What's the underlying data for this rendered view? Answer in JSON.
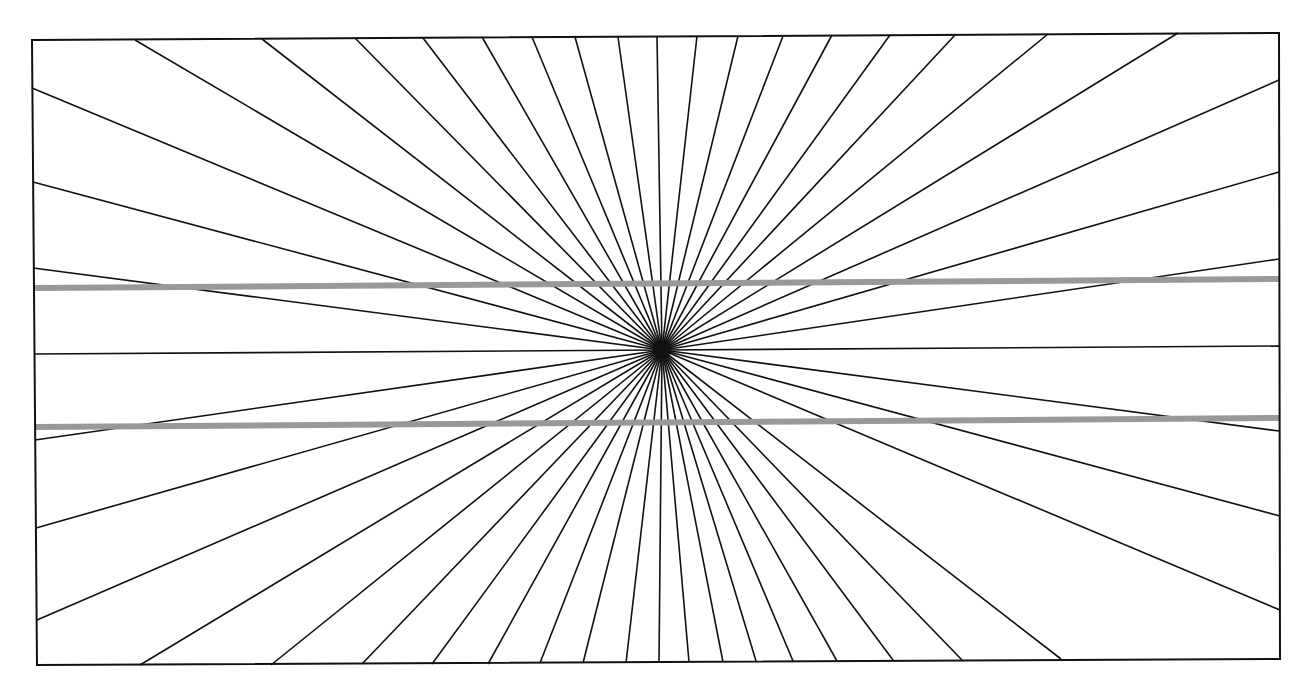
{
  "figure": {
    "center": [
      662,
      350
    ],
    "frame": {
      "tl": [
        32,
        40
      ],
      "tr": [
        1279,
        33
      ],
      "br": [
        1280,
        659
      ],
      "bl": [
        37,
        665
      ]
    },
    "ray_color": "#111111",
    "frame_color": "#111111",
    "parallel_line_color": "#999999",
    "parallel_lines": [
      {
        "x1": 34,
        "y1": 288,
        "x2": 1280,
        "y2": 279
      },
      {
        "x1": 36,
        "y1": 427,
        "x2": 1280,
        "y2": 418
      }
    ],
    "ray_endpoints": [
      [
        135,
        40
      ],
      [
        262,
        39
      ],
      [
        355,
        38
      ],
      [
        423,
        38
      ],
      [
        482,
        37
      ],
      [
        532,
        37
      ],
      [
        575,
        37
      ],
      [
        618,
        37
      ],
      [
        657,
        36
      ],
      [
        697,
        36
      ],
      [
        738,
        36
      ],
      [
        783,
        36
      ],
      [
        832,
        35
      ],
      [
        890,
        35
      ],
      [
        955,
        35
      ],
      [
        1048,
        34
      ],
      [
        1178,
        33
      ],
      [
        1279,
        80
      ],
      [
        1279,
        172
      ],
      [
        1279,
        259
      ],
      [
        1279,
        346
      ],
      [
        1279,
        431
      ],
      [
        1280,
        516
      ],
      [
        1280,
        610
      ],
      [
        1061,
        659
      ],
      [
        962,
        660
      ],
      [
        893,
        660
      ],
      [
        837,
        661
      ],
      [
        793,
        661
      ],
      [
        756,
        661
      ],
      [
        723,
        662
      ],
      [
        689,
        662
      ],
      [
        659,
        662
      ],
      [
        626,
        663
      ],
      [
        583,
        663
      ],
      [
        540,
        663
      ],
      [
        488,
        664
      ],
      [
        432,
        664
      ],
      [
        362,
        664
      ],
      [
        271,
        665
      ],
      [
        140,
        665
      ],
      [
        37,
        620
      ],
      [
        36,
        528
      ],
      [
        35,
        440
      ],
      [
        34,
        354
      ],
      [
        33,
        268
      ],
      [
        33,
        182
      ],
      [
        32,
        88
      ]
    ]
  }
}
